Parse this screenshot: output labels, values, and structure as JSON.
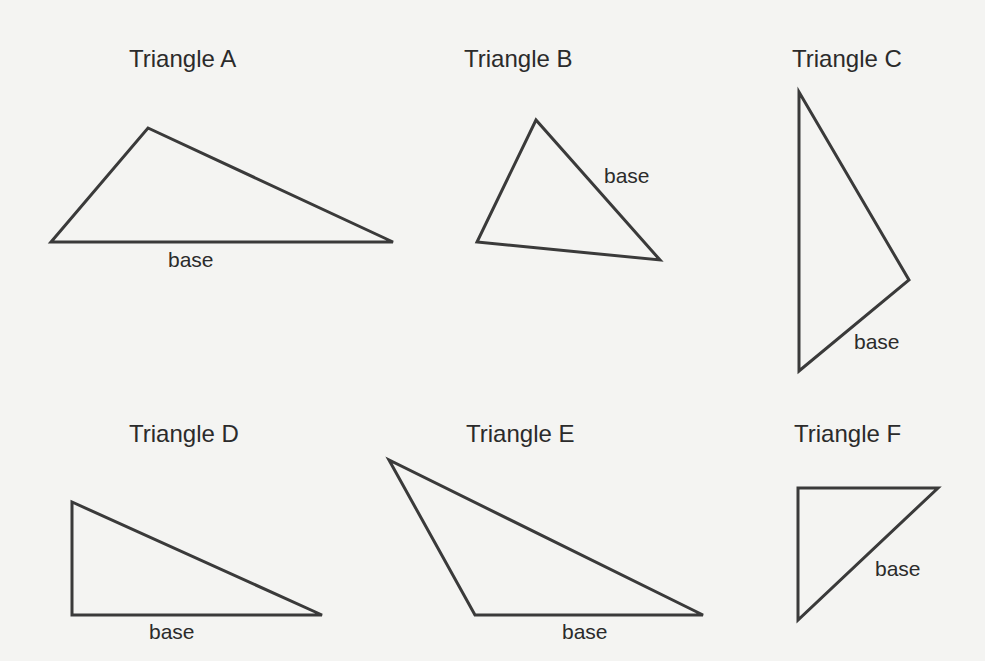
{
  "diagram": {
    "stroke_color": "#3a3a3a",
    "background": "#f4f4f2",
    "triangles": [
      {
        "id": "A",
        "title": "Triangle A",
        "base_label": "base",
        "vertices": [
          [
            51,
            242
          ],
          [
            148,
            128
          ],
          [
            393,
            242
          ]
        ],
        "title_pos": [
          129,
          45
        ],
        "label_pos": [
          168,
          248
        ]
      },
      {
        "id": "B",
        "title": "Triangle B",
        "base_label": "base",
        "vertices": [
          [
            536,
            120
          ],
          [
            477,
            242
          ],
          [
            660,
            260
          ]
        ],
        "title_pos": [
          464,
          45
        ],
        "label_pos": [
          604,
          164
        ]
      },
      {
        "id": "C",
        "title": "Triangle C",
        "base_label": "base",
        "vertices": [
          [
            799,
            92
          ],
          [
            909,
            280
          ],
          [
            799,
            371
          ]
        ],
        "title_pos": [
          792,
          45
        ],
        "label_pos": [
          854,
          330
        ]
      },
      {
        "id": "D",
        "title": "Triangle D",
        "base_label": "base",
        "vertices": [
          [
            72,
            502
          ],
          [
            72,
            615
          ],
          [
            322,
            615
          ]
        ],
        "title_pos": [
          129,
          420
        ],
        "label_pos": [
          149,
          620
        ]
      },
      {
        "id": "E",
        "title": "Triangle E",
        "base_label": "base",
        "vertices": [
          [
            389,
            460
          ],
          [
            475,
            615
          ],
          [
            703,
            615
          ]
        ],
        "title_pos": [
          466,
          420
        ],
        "label_pos": [
          562,
          620
        ]
      },
      {
        "id": "F",
        "title": "Triangle F",
        "base_label": "base",
        "vertices": [
          [
            798,
            488
          ],
          [
            938,
            488
          ],
          [
            798,
            620
          ]
        ],
        "title_pos": [
          794,
          420
        ],
        "label_pos": [
          875,
          557
        ]
      }
    ]
  }
}
